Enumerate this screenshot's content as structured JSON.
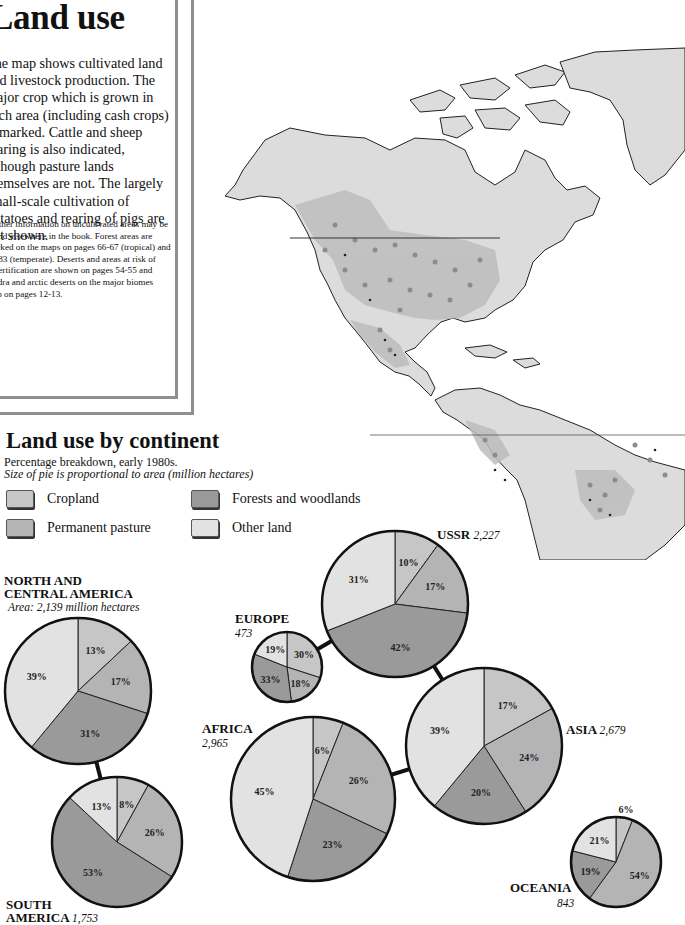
{
  "intro": {
    "title": "Land use",
    "body": "The map shows cultivated land and livestock production. The major crop which is grown in each area (including cash crops) is marked. Cattle and sheep rearing is also indicated, although pasture lands themselves are not. The largely small-scale cultivation of potatoes and rearing of pigs are not shown.",
    "note": "Further information on uncultivated areas may be found elsewhere in the book. Forest areas are marked on the maps on pages 66-67 (tropical) and 82-83 (temperate). Deserts and areas at risk of desertification are shown on pages 54-55 and tundra and arctic deserts on the major biomes map on pages 12-13."
  },
  "section": {
    "title": "Land use by continent",
    "subtitle": "Percentage breakdown, early 1980s.",
    "subtitle_italic": "Size of pie is proportional to area (million hectares)"
  },
  "legend": [
    {
      "label": "Cropland",
      "color": "#c6c6c6"
    },
    {
      "label": "Permanent pasture",
      "color": "#b4b4b4"
    },
    {
      "label": "Forests and woodlands",
      "color": "#9a9a9a"
    },
    {
      "label": "Other land",
      "color": "#e2e2e2"
    }
  ],
  "labels": {
    "north_america_line1": "NORTH AND",
    "north_america_line2": "CENTRAL AMERICA",
    "north_america_area": "Area: 2,139 million hectares",
    "south_america_line1": "SOUTH",
    "south_america_line2": "AMERICA",
    "south_america_area": "1,753",
    "europe": "EUROPE",
    "europe_area": "473",
    "ussr": "USSR",
    "ussr_area": "2,227",
    "africa": "AFRICA",
    "africa_area": "2,965",
    "asia": "ASIA",
    "asia_area": "2,679",
    "oceania": "OCEANIA",
    "oceania_area": "843"
  },
  "chart_data": {
    "type": "pie",
    "title": "Land use by continent",
    "subtitle": "Percentage breakdown, early 1980s. Size of pie is proportional to area (million hectares)",
    "categories": [
      "Cropland",
      "Permanent pasture",
      "Forests and woodlands",
      "Other land"
    ],
    "legend_position": "top",
    "series": [
      {
        "name": "North and Central America",
        "area_million_ha": 2139,
        "values": [
          13,
          17,
          31,
          39
        ]
      },
      {
        "name": "South America",
        "area_million_ha": 1753,
        "values": [
          8,
          26,
          53,
          13
        ]
      },
      {
        "name": "Europe",
        "area_million_ha": 473,
        "values": [
          30,
          18,
          33,
          19
        ]
      },
      {
        "name": "USSR",
        "area_million_ha": 2227,
        "values": [
          10,
          17,
          42,
          31
        ]
      },
      {
        "name": "Africa",
        "area_million_ha": 2965,
        "values": [
          6,
          26,
          23,
          45
        ]
      },
      {
        "name": "Asia",
        "area_million_ha": 2679,
        "values": [
          17,
          24,
          20,
          39
        ]
      },
      {
        "name": "Oceania",
        "area_million_ha": 843,
        "values": [
          6,
          54,
          19,
          21
        ]
      }
    ]
  },
  "pies": [
    {
      "id": "north-america",
      "cx": 78,
      "cy": 691,
      "r": 73,
      "values": [
        13,
        17,
        31,
        39
      ]
    },
    {
      "id": "south-america",
      "cx": 117,
      "cy": 842,
      "r": 65,
      "values": [
        8,
        26,
        53,
        13
      ]
    },
    {
      "id": "europe",
      "cx": 287,
      "cy": 667,
      "r": 35,
      "values": [
        30,
        18,
        33,
        19
      ]
    },
    {
      "id": "ussr",
      "cx": 395,
      "cy": 604,
      "r": 73,
      "values": [
        10,
        17,
        42,
        31
      ]
    },
    {
      "id": "africa",
      "cx": 313,
      "cy": 799,
      "r": 82,
      "values": [
        6,
        26,
        23,
        45
      ]
    },
    {
      "id": "asia",
      "cx": 484,
      "cy": 746,
      "r": 78,
      "values": [
        17,
        24,
        20,
        39
      ]
    },
    {
      "id": "oceania",
      "cx": 616,
      "cy": 862,
      "r": 45,
      "values": [
        6,
        54,
        19,
        21
      ]
    }
  ],
  "connectors": [
    {
      "from": "north-america",
      "to": "south-america"
    },
    {
      "from": "europe",
      "to": "ussr"
    },
    {
      "from": "ussr",
      "to": "asia"
    },
    {
      "from": "africa",
      "to": "asia"
    }
  ],
  "map": {
    "land_color": "#dcdcdc",
    "crop_color": "#bdbdbd",
    "dot_color": "#8c8c8c"
  }
}
